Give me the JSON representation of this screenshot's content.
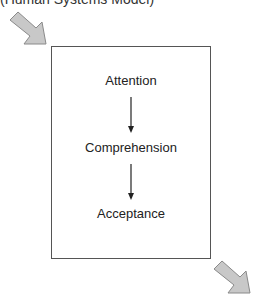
{
  "caption": "(Human Systems Model)",
  "stages": [
    "Attention",
    "Comprehension",
    "Acceptance"
  ],
  "colors": {
    "arrow_fill": "#c8c8c8",
    "arrow_stroke": "#8a8a8a",
    "box_border": "#555555"
  }
}
